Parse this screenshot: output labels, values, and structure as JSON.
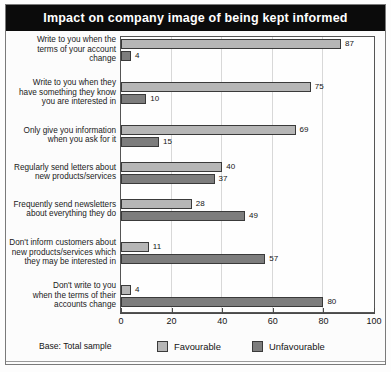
{
  "title": "Impact on company image of being kept informed",
  "footer": {
    "base_label": "Base: Total sample"
  },
  "legend": {
    "favourable": "Favourable",
    "unfavourable": "Unfavourable"
  },
  "colors": {
    "favourable": "#b6b6b6",
    "unfavourable": "#7d7d7d",
    "title_background": "#0b0b0b",
    "title_text": "#ffffff"
  },
  "chart_data": {
    "type": "bar",
    "orientation": "horizontal",
    "title": "Impact on company image of being kept informed",
    "xlabel": "",
    "ylabel": "",
    "xlim": [
      0,
      100
    ],
    "xticks": [
      0,
      20,
      40,
      60,
      80,
      100
    ],
    "grid": false,
    "legend_position": "bottom",
    "categories": [
      "Write to you when the terms of your account change",
      "Write to you when they have something they know you are interested in",
      "Only give you information when you ask for it",
      "Regularly send letters about new products/services",
      "Frequently send newsletters about everything they do",
      "Don't inform customers about new products/services which they may be interested in",
      "Don't write to you when the terms of their accounts change"
    ],
    "category_lines": [
      [
        "Write to you when the",
        "terms of your account",
        "change"
      ],
      [
        "Write to you when they",
        "have something they know",
        "you are interested in"
      ],
      [
        "Only give you information",
        "when you ask for it"
      ],
      [
        "Regularly send letters about",
        "new products/services"
      ],
      [
        "Frequently send newsletters",
        "about everything they do"
      ],
      [
        "Don't inform customers about",
        "new products/services which",
        "they may be interested in"
      ],
      [
        "Don't write to you",
        "when the terms of their",
        "accounts change"
      ]
    ],
    "series": [
      {
        "name": "Favourable",
        "color": "#b6b6b6",
        "values": [
          87,
          75,
          69,
          40,
          28,
          11,
          4
        ]
      },
      {
        "name": "Unfavourable",
        "color": "#7d7d7d",
        "values": [
          4,
          10,
          15,
          37,
          49,
          57,
          80
        ]
      }
    ]
  }
}
